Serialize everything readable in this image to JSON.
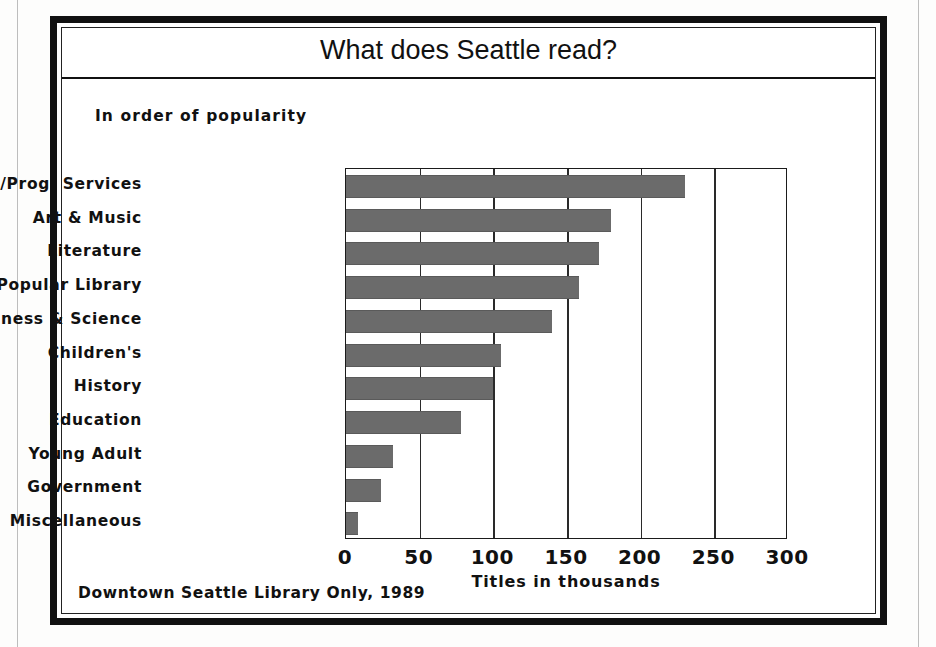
{
  "figure": {
    "title": "What does Seattle read?",
    "subtitle": "In order of popularity",
    "footnote": "Downtown Seattle Library Only, 1989"
  },
  "colors": {
    "bar_fill": "#6b6b6b",
    "frame": "#111111",
    "background": "#ffffff",
    "text": "#111111"
  },
  "chart_data": {
    "type": "bar",
    "orientation": "horizontal",
    "title": "What does Seattle read?",
    "subtitle": "In order of popularity",
    "footnote": "Downtown Seattle Library Only, 1989",
    "xlabel": "Titles in thousands",
    "ylabel": "",
    "xlim": [
      0,
      300
    ],
    "xticks": [
      0,
      50,
      100,
      150,
      200,
      250,
      300
    ],
    "xtick_labels": [
      "0",
      "50",
      "100",
      "150",
      "200",
      "250",
      "300"
    ],
    "grid": "vertical",
    "legend": "none",
    "categories": [
      "Media/Prog. Services",
      "Art & Music",
      "Literature",
      "Popular Library",
      "Business & Science",
      "Children's",
      "History",
      "Education",
      "Young Adult",
      "Government",
      "Miscellaneous"
    ],
    "values": [
      230,
      180,
      172,
      158,
      140,
      105,
      100,
      78,
      32,
      24,
      8
    ],
    "units": "thousands of titles"
  }
}
